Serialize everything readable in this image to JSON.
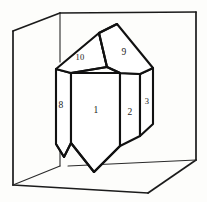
{
  "figure": {
    "ink_color": "#111111",
    "background_color": "#fdfdfb"
  },
  "box": {
    "name": "reference-box",
    "style": "wireframe open box, oblique projection",
    "edge_color": "#1b1b1b",
    "vertices": {
      "back_top_left": "13,31",
      "back_top_mid": "60,13",
      "back_top_right": "196,12",
      "front_bottom_left": "13,185",
      "front_bottom_mid": "148,193",
      "front_bottom_right": "196,160"
    }
  },
  "crystal": {
    "name": "quartz-crystal",
    "habit": "hexagonal prism with rhombohedral terminations",
    "prism_faces": [
      "1",
      "2",
      "3",
      "8"
    ],
    "termination_faces": [
      "9",
      "10"
    ]
  },
  "labels": [
    {
      "id": "face-10",
      "text": "10",
      "x": 80,
      "y": 58,
      "face": "termination-left"
    },
    {
      "id": "face-9",
      "text": "9",
      "x": 124,
      "y": 53,
      "face": "termination-right"
    },
    {
      "id": "face-8",
      "text": "8",
      "x": 61,
      "y": 106,
      "face": "prism-far-left"
    },
    {
      "id": "face-1",
      "text": "1",
      "x": 96,
      "y": 111,
      "face": "prism-front"
    },
    {
      "id": "face-2",
      "text": "2",
      "x": 130,
      "y": 113,
      "face": "prism-right"
    },
    {
      "id": "face-3",
      "text": "3",
      "x": 147,
      "y": 102,
      "face": "prism-far-right"
    }
  ]
}
